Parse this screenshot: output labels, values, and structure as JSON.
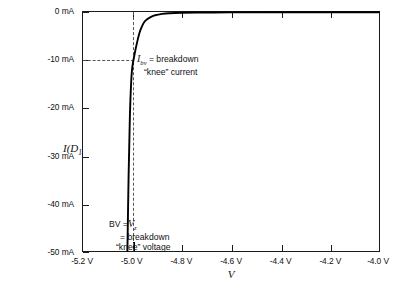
{
  "chart_data": {
    "type": "line",
    "title": "",
    "subtitle": "",
    "xlabel": "V",
    "ylabel": "I(D1)",
    "ylabel_parts": {
      "symbol": "I",
      "open": "(",
      "arg": "D",
      "arg_sub": "1",
      "close": ")"
    },
    "xlim": [
      -5.2,
      -4.0
    ],
    "ylim": [
      -50,
      0
    ],
    "grid": false,
    "legend": "none",
    "x_tick_labels": [
      "-5.2 V",
      "-5.0 V",
      "-4.8 V",
      "-4.6 V",
      "-4.4 V",
      "-4.2 V",
      "-4.0 V"
    ],
    "x_tick_values": [
      -5.2,
      -5.0,
      -4.8,
      -4.6,
      -4.4,
      -4.2,
      -4.0
    ],
    "y_tick_labels": [
      "0 mA",
      "-10 mA",
      "-20 mA",
      "-30 mA",
      "-40 mA",
      "-50 mA"
    ],
    "y_tick_values": [
      0,
      -10,
      -20,
      -30,
      -40,
      -50
    ],
    "x_units": "V",
    "y_units": "mA",
    "series": [
      {
        "name": "I(D1)",
        "x": [
          -4.0,
          -4.2,
          -4.4,
          -4.6,
          -4.7,
          -4.8,
          -4.85,
          -4.88,
          -4.9,
          -4.92,
          -4.94,
          -4.95,
          -4.96,
          -4.97,
          -4.98,
          -4.99,
          -5.0,
          -5.005,
          -5.01,
          -5.015,
          -5.02
        ],
        "y": [
          -0.05,
          -0.05,
          -0.06,
          -0.08,
          -0.1,
          -0.15,
          -0.25,
          -0.4,
          -0.6,
          -0.9,
          -1.5,
          -2.0,
          -2.9,
          -4.2,
          -6.2,
          -8.6,
          -11.5,
          -15.0,
          -22.0,
          -34.0,
          -50.0
        ]
      }
    ],
    "guides": {
      "vertical_dashed_at_x": -5.0,
      "horizontal_dashed_at_y": -10,
      "horizontal_dashed_from_x": -5.2,
      "horizontal_dashed_to_x": -4.995
    },
    "annotations": [
      {
        "id": "ibv",
        "symbol": "I",
        "subscript": "bv",
        "line1_rest": " = breakdown",
        "line2": "“knee” current",
        "x": -4.985,
        "y": -10
      },
      {
        "id": "bv",
        "line1": "BV =",
        "line1_symbol": "V",
        "line1_subscript": "z",
        "line2": "= breakdown",
        "line3": "“knee” voltage",
        "x": -5.0,
        "y": -44
      }
    ],
    "colors": {
      "curve": "#000000",
      "axis": "#1a1a1a",
      "guide": "#555555",
      "background": "#ffffff",
      "text": "#111111"
    }
  }
}
